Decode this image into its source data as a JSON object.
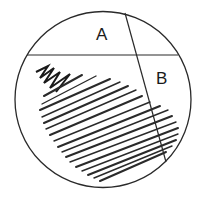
{
  "diagram": {
    "type": "streak-plate",
    "colors": {
      "stroke": "#2a2a2a",
      "background": "#ffffff"
    },
    "dish": {
      "cx": 103,
      "cy": 99.5,
      "r": 88
    },
    "divider_horizontal": {
      "x1": 27,
      "y1": 55,
      "x2": 178,
      "y2": 55
    },
    "divider_diagonal": {
      "x1": 125,
      "y1": 13,
      "x2": 166,
      "y2": 162
    },
    "regions": [
      {
        "id": "A",
        "label": "A",
        "x": 96,
        "y": 26
      },
      {
        "id": "B",
        "label": "B",
        "x": 156,
        "y": 70
      }
    ],
    "zigzag": "M36,72 L48,66 L40,78 L54,68 L44,83 L60,72 L50,88 L70,74 L56,92",
    "hatch_lines": [
      [
        44,
        96,
        82,
        75
      ],
      [
        42,
        104,
        96,
        76
      ],
      [
        40,
        110,
        110,
        79
      ],
      [
        42,
        117,
        120,
        82
      ],
      [
        44,
        123,
        128,
        86
      ],
      [
        46,
        129,
        136,
        90
      ],
      [
        50,
        135,
        142,
        96
      ],
      [
        54,
        141,
        150,
        102
      ],
      [
        58,
        147,
        160,
        106
      ],
      [
        62,
        152,
        168,
        110
      ],
      [
        66,
        157,
        172,
        116
      ],
      [
        70,
        162,
        176,
        122
      ],
      [
        76,
        167,
        178,
        128
      ],
      [
        82,
        171,
        178,
        134
      ],
      [
        88,
        175,
        176,
        140
      ],
      [
        94,
        178,
        172,
        146
      ],
      [
        100,
        181,
        166,
        152
      ]
    ]
  }
}
